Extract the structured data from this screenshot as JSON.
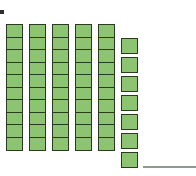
{
  "figure": {
    "kind": "base-ten-blocks",
    "bullet_marker": "▪",
    "colors": {
      "cube_fill": "#8cc472",
      "cube_border": "#2c3a21",
      "answer_line": "#8e9a8e",
      "bullet": "#2f2f2f",
      "background": "#ffffff"
    },
    "rods": {
      "count": 5,
      "cubes_per_rod": 10,
      "label": "tens rods",
      "x_positions": [
        6,
        29,
        52,
        75,
        98
      ],
      "y_top": 24
    },
    "loose_units": {
      "count": 7,
      "label": "ones cubes",
      "x_position": 121,
      "y_top": 38
    },
    "totals": {
      "tens": 5,
      "ones": 7,
      "value": 57
    },
    "answer_line": {
      "label": "answer blank",
      "x": 143,
      "y": 166,
      "width": 53
    }
  }
}
